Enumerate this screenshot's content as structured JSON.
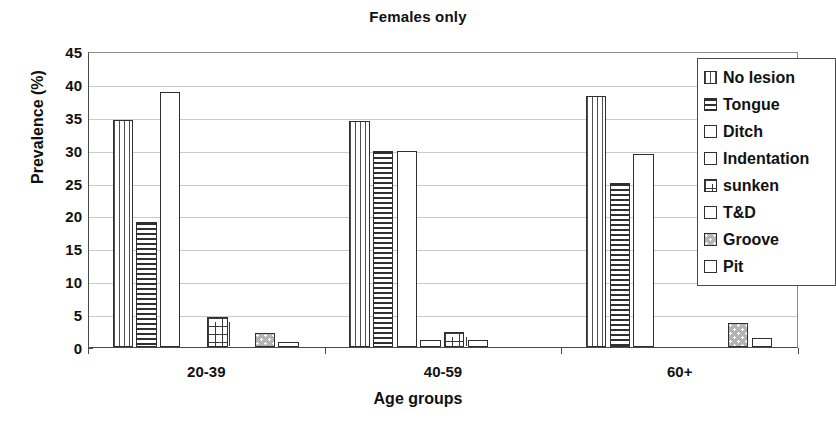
{
  "chart_data": {
    "type": "bar",
    "title": "Females only",
    "xlabel": "Age groups",
    "ylabel": "Prevalence (%)",
    "ylim": [
      0,
      45
    ],
    "ytick_step": 5,
    "yticks": [
      45,
      40,
      35,
      30,
      25,
      20,
      15,
      10,
      5,
      0
    ],
    "grid": true,
    "legend_position": "top-right-inside",
    "categories": [
      "20-39",
      "40-59",
      "60+"
    ],
    "series": [
      {
        "name": "No lesion",
        "pattern": "vertical-lines",
        "values": [
          34.5,
          34.4,
          38.2
        ]
      },
      {
        "name": "Tongue",
        "pattern": "horizontal-lines",
        "values": [
          19.0,
          29.8,
          25.0
        ]
      },
      {
        "name": "Ditch",
        "pattern": "empty",
        "values": [
          38.8,
          29.8,
          29.4
        ]
      },
      {
        "name": "Indentation",
        "pattern": "empty",
        "values": [
          0.0,
          1.0,
          0.0
        ]
      },
      {
        "name": "sunken",
        "pattern": "brick",
        "values": [
          4.5,
          2.3,
          0.0
        ]
      },
      {
        "name": "T&D",
        "pattern": "empty",
        "values": [
          0.0,
          1.0,
          0.0
        ]
      },
      {
        "name": "Groove",
        "pattern": "dotted-grey",
        "values": [
          2.2,
          0.0,
          3.6
        ]
      },
      {
        "name": "Pit",
        "pattern": "empty",
        "values": [
          0.8,
          0.0,
          1.3
        ]
      }
    ]
  },
  "legend": {
    "items": [
      {
        "label": "No lesion"
      },
      {
        "label": "Tongue"
      },
      {
        "label": "Ditch"
      },
      {
        "label": "Indentation"
      },
      {
        "label": "sunken"
      },
      {
        "label": "T&D"
      },
      {
        "label": "Groove"
      },
      {
        "label": "Pit"
      }
    ]
  },
  "colors": {
    "axis": "#4a4a4a",
    "grid": "#c9c9c9",
    "text": "#111111",
    "bar_outline": "#303030",
    "groove_fill": "#b4b4b4",
    "background": "#ffffff"
  }
}
